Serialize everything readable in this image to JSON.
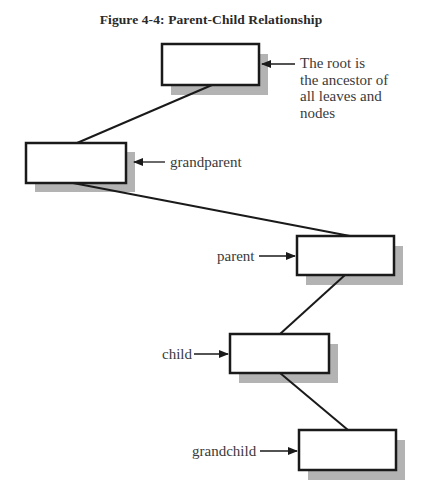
{
  "figure": {
    "title": "Figure 4-4:  Parent-Child Relationship"
  },
  "colors": {
    "box_border": "#1a1a1a",
    "box_fill": "#ffffff",
    "shadow": "#b3b3b3",
    "line": "#1a1a1a",
    "text": "#3a3a3a"
  },
  "nodes": [
    {
      "id": "root",
      "x": 162,
      "y": 44,
      "w": 97,
      "h": 41,
      "label_lines": [
        "The root is",
        "the ancestor of",
        "all leaves and",
        "nodes"
      ],
      "label_side": "right"
    },
    {
      "id": "grandparent",
      "x": 26,
      "y": 143,
      "w": 100,
      "h": 40,
      "label": "grandparent",
      "label_side": "right"
    },
    {
      "id": "parent",
      "x": 297,
      "y": 236,
      "w": 97,
      "h": 39,
      "label": "parent",
      "label_side": "left"
    },
    {
      "id": "child",
      "x": 230,
      "y": 334,
      "w": 99,
      "h": 39,
      "label": "child",
      "label_side": "left"
    },
    {
      "id": "grandchild",
      "x": 299,
      "y": 430,
      "w": 97,
      "h": 40,
      "label": "grandchild",
      "label_side": "left"
    }
  ],
  "edges": [
    {
      "from": "root",
      "to": "grandparent",
      "x1": 212,
      "y1": 85,
      "x2": 77,
      "y2": 143
    },
    {
      "from": "grandparent",
      "to": "parent",
      "x1": 73,
      "y1": 183,
      "x2": 350,
      "y2": 236
    },
    {
      "from": "parent",
      "to": "child",
      "x1": 345,
      "y1": 275,
      "x2": 280,
      "y2": 334
    },
    {
      "from": "child",
      "to": "grandchild",
      "x1": 280,
      "y1": 373,
      "x2": 348,
      "y2": 430
    }
  ],
  "labels": {
    "root_note": [
      "The root is",
      "the ancestor of",
      "all leaves and",
      "nodes"
    ],
    "grandparent": "grandparent",
    "parent": "parent",
    "child": "child",
    "grandchild": "grandchild"
  }
}
